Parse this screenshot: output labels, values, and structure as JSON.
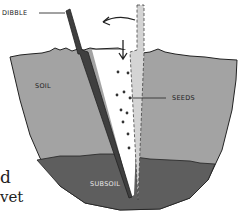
{
  "diagram": {
    "labels": {
      "dibble": "DIBBLE",
      "soil": "SOIL",
      "seeds": "SEEDS",
      "subsoil": "SUBSOIL"
    },
    "colors": {
      "soil": "#a3a3a3",
      "subsoil": "#5e5e5e",
      "dibble": "#3f3f3f",
      "hole_ghost": "#d4d4d4",
      "outline": "#222222",
      "seed": "#333333"
    }
  },
  "background_text": {
    "line1": "d",
    "line2": "vet"
  }
}
